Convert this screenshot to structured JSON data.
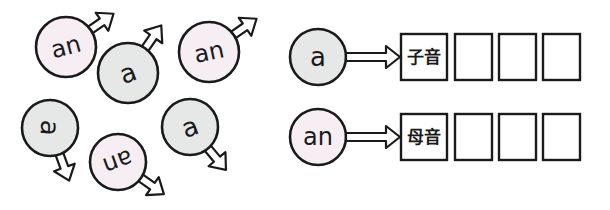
{
  "colors": {
    "vowel_fill": "#f6eef3",
    "consonant_fill": "#e6e8e7",
    "stroke": "#1a1a1a",
    "empty_box_fill": "#ffffff"
  },
  "cluster": {
    "items": [
      {
        "text": "an",
        "type": "vowel",
        "cx": 66,
        "cy": 47,
        "r": 30,
        "rotate": -15,
        "arrow_angle": -35
      },
      {
        "text": "a",
        "type": "consonant",
        "cx": 128,
        "cy": 73,
        "r": 30,
        "rotate": -20,
        "arrow_angle": -55
      },
      {
        "text": "an",
        "type": "vowel",
        "cx": 209,
        "cy": 52,
        "r": 30,
        "rotate": -12,
        "arrow_angle": -35
      },
      {
        "text": "a",
        "type": "consonant",
        "cx": 50,
        "cy": 128,
        "r": 28,
        "rotate": 95,
        "arrow_angle": 70
      },
      {
        "text": "an",
        "type": "vowel",
        "cx": 118,
        "cy": 162,
        "r": 28,
        "rotate": 160,
        "arrow_angle": 35
      },
      {
        "text": "a",
        "type": "consonant",
        "cx": 190,
        "cy": 127,
        "r": 28,
        "rotate": -20,
        "arrow_angle": 50
      }
    ]
  },
  "rows": [
    {
      "circle_text": "a",
      "type": "consonant",
      "label_box": "子音",
      "empty_boxes": 3,
      "y": 57
    },
    {
      "circle_text": "an",
      "type": "vowel",
      "label_box": "母音",
      "empty_boxes": 3,
      "y": 137
    }
  ]
}
